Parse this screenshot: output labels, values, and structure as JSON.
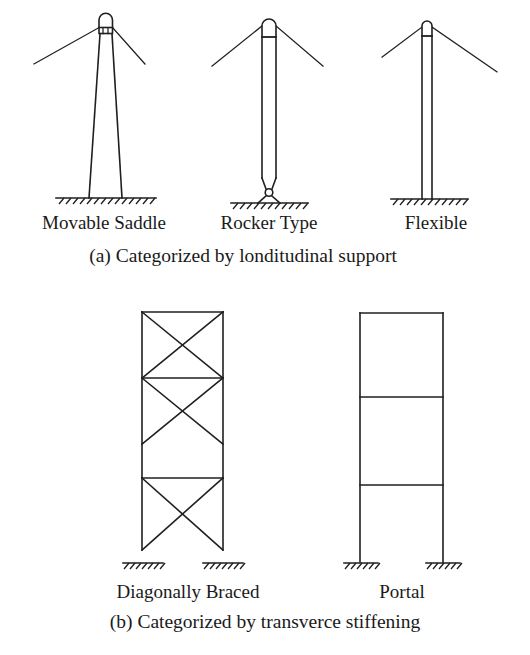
{
  "figure": {
    "background_color": "#ffffff",
    "line_color": "#1f1f1f",
    "text_color": "#1a1a1a"
  },
  "panel_a": {
    "caption": "(a) Categorized by londitudinal support",
    "items": [
      {
        "label": "Movable Saddle",
        "description": "Tapered tower with rounded saddle cap containing rollers, fixed hatched ground base"
      },
      {
        "label": "Rocker Type",
        "description": "Straight tower with rounded cap, tapering to a rocker pin on a base plate over hatched ground"
      },
      {
        "label": "Flexible",
        "description": "Slender straight tower with rounded cap, fixed hatched ground base"
      }
    ]
  },
  "panel_b": {
    "caption": "(b) Categorized by transverce stiffening",
    "items": [
      {
        "label": "Diagonally Braced",
        "description": "Two-column frame with X bracing in upper panels and a lower braced panel, hatched ground supports"
      },
      {
        "label": "Portal",
        "description": "Two-column portal frame with top beam and two intermediate beams, hatched ground supports"
      }
    ]
  }
}
